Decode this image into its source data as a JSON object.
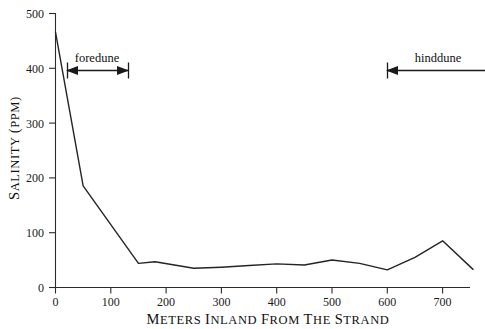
{
  "chart_data": {
    "type": "line",
    "title": "",
    "xlabel": "Meters Inland from the Strand",
    "ylabel": "Salinity (PPM)",
    "xlim": [
      0,
      760
    ],
    "ylim": [
      0,
      500
    ],
    "grid": false,
    "legend_position": "none",
    "x_ticks": [
      0,
      100,
      200,
      300,
      400,
      500,
      600,
      700
    ],
    "x_tick_labels": [
      "0",
      "100",
      "200",
      "300",
      "400",
      "500",
      "600",
      "700"
    ],
    "y_ticks": [
      0,
      100,
      200,
      300,
      400,
      500
    ],
    "y_tick_labels": [
      "0",
      "100",
      "200",
      "300",
      "400",
      "500"
    ],
    "series": [
      {
        "name": "Salinity",
        "x": [
          0,
          50,
          150,
          180,
          250,
          300,
          350,
          400,
          450,
          500,
          550,
          600,
          650,
          700,
          755
        ],
        "values": [
          465,
          185,
          44,
          47,
          35,
          37,
          40,
          43,
          41,
          50,
          44,
          32,
          55,
          85,
          33
        ]
      }
    ],
    "annotations": [
      {
        "label": "foredune",
        "type": "span-arrow",
        "x_start": 20,
        "x_end": 133,
        "y": 400,
        "label_x": 76,
        "label_y": 437
      },
      {
        "label": "hinddune",
        "type": "span-arrow-open-right",
        "x_start": 600,
        "x_end": 760,
        "y": 400,
        "label_x": 690,
        "label_y": 437
      }
    ]
  },
  "axis_titles": {
    "x_parts": [
      {
        "cap": "M",
        "rest": "ETERS"
      },
      {
        "cap": "I",
        "rest": "NLAND"
      },
      {
        "cap": "F",
        "rest": "ROM"
      },
      {
        "cap": "T",
        "rest": "HE"
      },
      {
        "cap": "S",
        "rest": "TRAND"
      }
    ],
    "y_parts": [
      {
        "cap": "S",
        "rest": "ALINITY"
      },
      {
        "cap": "(",
        "rest": "PPM)"
      }
    ]
  }
}
